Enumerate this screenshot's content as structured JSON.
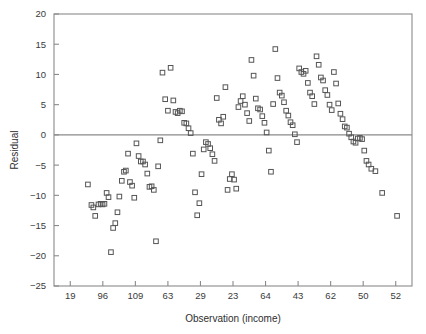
{
  "chart_data": {
    "type": "scatter",
    "title": "",
    "xlabel": "Observation (income)",
    "ylabel": "Residual",
    "ylim": [
      -25,
      20
    ],
    "yticks": [
      20,
      15,
      10,
      5,
      0,
      -5,
      -10,
      -15,
      -20,
      -25
    ],
    "ytick_labels": [
      "20",
      "15",
      "10",
      "5",
      "0",
      "-5",
      "-10",
      "-15",
      "-20",
      "-25"
    ],
    "xlim": [
      0,
      132
    ],
    "xtick_labels": [
      "19",
      "96",
      "109",
      "63",
      "29",
      "23",
      "64",
      "43",
      "62",
      "50",
      "52"
    ],
    "xtick_positions": [
      6,
      18,
      30,
      42,
      54,
      66,
      78,
      90,
      102,
      114,
      126
    ],
    "grid": false,
    "legend": null,
    "zero_reference_line": 0,
    "marker": "open-square",
    "marker_color": "#555555",
    "axis_color": "#8a8a8a",
    "n_points": 131,
    "points": [
      [
        12.5,
        -8.2
      ],
      [
        13.8,
        -11.6
      ],
      [
        14.5,
        -12.0
      ],
      [
        15.2,
        -13.4
      ],
      [
        16.4,
        -11.5
      ],
      [
        17.2,
        -11.4
      ],
      [
        17.9,
        -11.5
      ],
      [
        18.6,
        -11.4
      ],
      [
        19.4,
        -9.6
      ],
      [
        20.1,
        -10.3
      ],
      [
        21.0,
        -19.4
      ],
      [
        21.8,
        -15.4
      ],
      [
        22.6,
        -14.6
      ],
      [
        23.4,
        -12.8
      ],
      [
        24.1,
        -10.2
      ],
      [
        25.0,
        -7.6
      ],
      [
        25.8,
        -6.1
      ],
      [
        26.5,
        -5.9
      ],
      [
        27.3,
        -3.1
      ],
      [
        28.0,
        -7.8
      ],
      [
        28.8,
        -8.4
      ],
      [
        29.6,
        -10.4
      ],
      [
        30.4,
        -1.4
      ],
      [
        31.2,
        -3.5
      ],
      [
        32.0,
        -4.4
      ],
      [
        32.8,
        -4.4
      ],
      [
        33.6,
        -4.9
      ],
      [
        34.4,
        -6.4
      ],
      [
        35.2,
        -8.6
      ],
      [
        36.0,
        -8.5
      ],
      [
        36.8,
        -9.1
      ],
      [
        37.6,
        -17.6
      ],
      [
        38.4,
        -5.2
      ],
      [
        39.2,
        -0.9
      ],
      [
        40.0,
        10.3
      ],
      [
        41.0,
        5.9
      ],
      [
        42.0,
        4.0
      ],
      [
        43.0,
        11.1
      ],
      [
        44.0,
        5.7
      ],
      [
        44.8,
        3.8
      ],
      [
        45.6,
        3.6
      ],
      [
        46.4,
        4.0
      ],
      [
        47.2,
        3.9
      ],
      [
        48.0,
        2.0
      ],
      [
        48.8,
        1.9
      ],
      [
        49.6,
        1.1
      ],
      [
        50.4,
        0.3
      ],
      [
        51.2,
        -3.1
      ],
      [
        52.0,
        -9.5
      ],
      [
        52.8,
        -13.3
      ],
      [
        53.6,
        -11.3
      ],
      [
        54.4,
        -6.5
      ],
      [
        55.2,
        -2.4
      ],
      [
        56.0,
        -1.2
      ],
      [
        56.8,
        -1.5
      ],
      [
        57.6,
        -2.2
      ],
      [
        58.4,
        -3.2
      ],
      [
        59.2,
        -4.3
      ],
      [
        60.0,
        6.1
      ],
      [
        60.8,
        2.5
      ],
      [
        61.6,
        1.9
      ],
      [
        62.4,
        3.0
      ],
      [
        63.2,
        7.9
      ],
      [
        64.0,
        -9.1
      ],
      [
        64.8,
        -7.3
      ],
      [
        65.6,
        -6.5
      ],
      [
        66.4,
        -7.4
      ],
      [
        67.2,
        -8.9
      ],
      [
        68.0,
        4.6
      ],
      [
        68.8,
        5.6
      ],
      [
        69.6,
        6.4
      ],
      [
        70.4,
        5.0
      ],
      [
        71.2,
        3.6
      ],
      [
        72.0,
        2.3
      ],
      [
        72.8,
        12.4
      ],
      [
        73.6,
        9.8
      ],
      [
        74.4,
        6.0
      ],
      [
        75.2,
        4.4
      ],
      [
        76.0,
        4.2
      ],
      [
        76.8,
        3.1
      ],
      [
        77.6,
        2.0
      ],
      [
        78.4,
        0.4
      ],
      [
        79.2,
        -2.6
      ],
      [
        80.0,
        -6.1
      ],
      [
        80.8,
        5.1
      ],
      [
        81.6,
        14.2
      ],
      [
        82.4,
        9.4
      ],
      [
        83.2,
        7.0
      ],
      [
        84.0,
        6.5
      ],
      [
        84.8,
        5.4
      ],
      [
        85.6,
        4.0
      ],
      [
        86.4,
        3.2
      ],
      [
        87.2,
        2.1
      ],
      [
        88.0,
        1.6
      ],
      [
        88.8,
        0.1
      ],
      [
        89.6,
        -1.2
      ],
      [
        90.4,
        11.0
      ],
      [
        91.2,
        10.4
      ],
      [
        92.0,
        10.1
      ],
      [
        92.8,
        10.6
      ],
      [
        93.6,
        8.6
      ],
      [
        94.4,
        7.0
      ],
      [
        95.2,
        6.4
      ],
      [
        96.0,
        5.1
      ],
      [
        96.8,
        13.0
      ],
      [
        97.6,
        11.6
      ],
      [
        98.4,
        9.5
      ],
      [
        99.2,
        9.0
      ],
      [
        100.0,
        7.4
      ],
      [
        100.8,
        6.6
      ],
      [
        101.6,
        5.0
      ],
      [
        102.4,
        4.1
      ],
      [
        103.2,
        10.4
      ],
      [
        104.0,
        8.5
      ],
      [
        104.8,
        5.2
      ],
      [
        105.6,
        3.5
      ],
      [
        106.4,
        2.6
      ],
      [
        107.2,
        1.4
      ],
      [
        108.0,
        1.2
      ],
      [
        108.8,
        0.2
      ],
      [
        109.6,
        -0.4
      ],
      [
        110.4,
        -1.1
      ],
      [
        111.2,
        -1.3
      ],
      [
        112.0,
        -0.6
      ],
      [
        112.8,
        -0.5
      ],
      [
        113.6,
        -0.7
      ],
      [
        114.4,
        -2.6
      ],
      [
        115.2,
        -4.3
      ],
      [
        116.0,
        -4.9
      ],
      [
        117.0,
        -5.6
      ],
      [
        118.5,
        -6.0
      ],
      [
        121.0,
        -9.6
      ],
      [
        126.5,
        -13.4
      ]
    ]
  }
}
